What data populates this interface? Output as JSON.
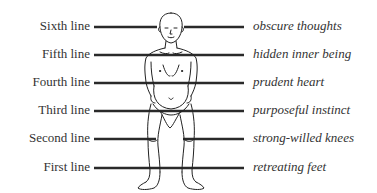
{
  "diagram": {
    "type": "body-correspondence",
    "colors": {
      "line": "#2a2a2a",
      "text": "#333333",
      "figure": "#222222",
      "background": "#ffffff"
    },
    "rows": [
      {
        "left": "Sixth line",
        "right": "obscure thoughts",
        "y": 27
      },
      {
        "left": "Fifth line",
        "right": "hidden inner being",
        "y": 55
      },
      {
        "left": "Fourth line",
        "right": "prudent heart",
        "y": 83
      },
      {
        "left": "Third line",
        "right": "purposeful instinct",
        "y": 111
      },
      {
        "left": "Second line",
        "right": "strong-willed knees",
        "y": 139
      },
      {
        "left": "First line",
        "right": "retreating feet",
        "y": 168
      }
    ],
    "figure": {
      "description": "standing human figure",
      "icon": "human-figure-icon"
    }
  }
}
